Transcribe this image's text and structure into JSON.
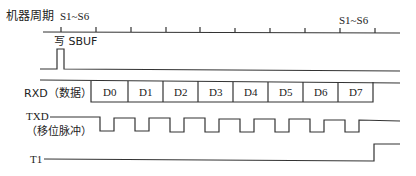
{
  "diagram": {
    "rows": {
      "machine_cycle": {
        "label": "机器周期",
        "start_state": "S1~S6",
        "end_state": "S1~S6"
      },
      "write_sbuf": {
        "label": "写 SBUF"
      },
      "rxd": {
        "label": "RXD（数据）",
        "bits": [
          "D0",
          "D1",
          "D2",
          "D3",
          "D4",
          "D5",
          "D6",
          "D7"
        ]
      },
      "txd": {
        "label": "TXD",
        "sublabel": "（移位脉冲）",
        "pulse_count": 8
      },
      "t1": {
        "label": "T1"
      }
    },
    "colors": {
      "line": "#333333",
      "text": "#222222",
      "background": "#ffffff"
    }
  }
}
